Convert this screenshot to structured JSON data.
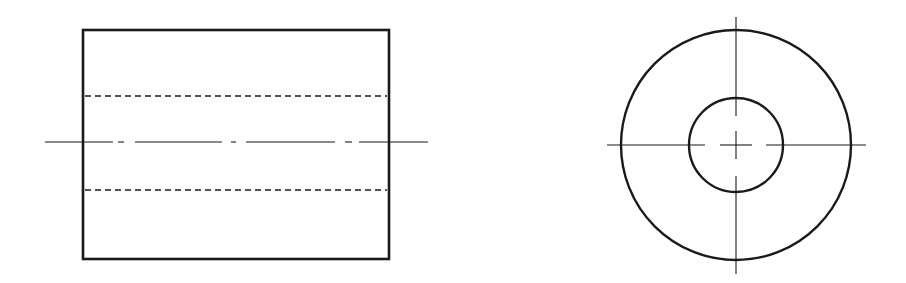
{
  "drawing": {
    "type": "orthographic-projection",
    "subject": "hollow cylinder (tube)",
    "colors": {
      "background": "#ffffff",
      "line": "#1a1a1a"
    },
    "front_view": {
      "outline": {
        "x": 83,
        "y": 30,
        "width": 306,
        "height": 229,
        "stroke_width": 2.6
      },
      "hidden_lines": [
        {
          "y": 96,
          "x1": 85,
          "x2": 387,
          "dash": "6 4",
          "stroke_width": 1.3
        },
        {
          "y": 190,
          "x1": 85,
          "x2": 387,
          "dash": "6 4",
          "stroke_width": 1.3
        }
      ],
      "center_line": {
        "y": 142,
        "x1": 45,
        "x2": 428,
        "segments": [
          [
            45,
            113
          ],
          [
            118,
            124
          ],
          [
            135,
            222
          ],
          [
            231,
            236
          ],
          [
            246,
            335
          ],
          [
            345,
            352
          ],
          [
            359,
            428
          ]
        ],
        "stroke_width": 1.1
      }
    },
    "side_view": {
      "center": {
        "x": 736,
        "y": 145
      },
      "outer_circle": {
        "r": 115,
        "stroke_width": 2.4
      },
      "inner_circle": {
        "r": 47,
        "stroke_width": 2.4
      },
      "center_lines": {
        "horizontal_segments": [
          [
            607,
            705
          ],
          [
            720,
            752
          ],
          [
            766,
            866
          ]
        ],
        "vertical_segments": [
          [
            17,
            116
          ],
          [
            131,
            159
          ],
          [
            176,
            274
          ]
        ],
        "stroke_width": 1.1
      }
    }
  }
}
